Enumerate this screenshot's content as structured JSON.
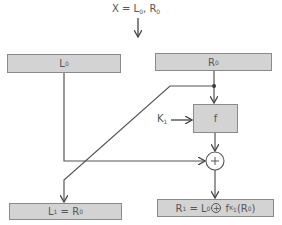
{
  "title": {
    "lhs": "X",
    "eq": " = ",
    "l": "L",
    "l_sub": "0",
    "sep": ", ",
    "r": "R",
    "r_sub": "0"
  },
  "boxes": {
    "L0": {
      "main": "L",
      "sub": "0"
    },
    "R0": {
      "main": "R",
      "sub": "0"
    },
    "f": {
      "main": "f"
    },
    "L1": {
      "a": "L",
      "a_sub": "1",
      "eq": " = ",
      "b": "R",
      "b_sub": "0"
    },
    "R1": {
      "a": "R",
      "a_sub": "1",
      "eq": " = ",
      "b": "L",
      "b_sub": "0",
      "xor": "+",
      "f": " f",
      "f_sub": "K",
      "f_subsub": "1",
      "arg_open": "(R",
      "arg_sub": "0",
      "arg_close": ")"
    }
  },
  "key": {
    "main": "K",
    "sub": "1"
  },
  "xor_symbol": "+",
  "colors": {
    "box_fill": "#d3d3d3",
    "box_border": "#8a8a8a",
    "line": "#555555"
  }
}
